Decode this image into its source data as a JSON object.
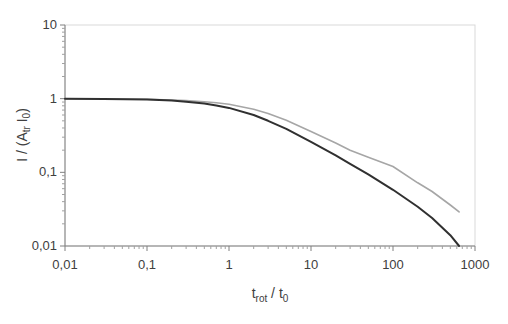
{
  "chart_data": {
    "type": "line",
    "title": "",
    "xlabel": "t_rot / t_0",
    "xlabel_main": "t",
    "xlabel_sub1": "rot",
    "xlabel_mid": " / t",
    "xlabel_sub2": "0",
    "ylabel": "I / (A_tr I_0)",
    "ylabel_pre": "I / (A",
    "ylabel_sub": "tr",
    "ylabel_mid": " I",
    "ylabel_sub2": "0",
    "ylabel_post": ")",
    "xscale": "log",
    "yscale": "log",
    "xlim": [
      0.01,
      1000
    ],
    "ylim": [
      0.01,
      10
    ],
    "grid": false,
    "legend": "none",
    "x_tick_labels": [
      "0,01",
      "0,1",
      "1",
      "10",
      "100",
      "1000"
    ],
    "y_tick_labels": [
      "0,01",
      "0,1",
      "1",
      "10"
    ],
    "series": [
      {
        "name": "dark curve",
        "color": "#303030",
        "x": [
          0.01,
          0.03,
          0.1,
          0.2,
          0.3,
          0.5,
          0.7,
          1,
          2,
          3,
          5,
          10,
          20,
          30,
          50,
          100,
          200,
          300,
          500,
          640
        ],
        "y": [
          1.0,
          0.99,
          0.97,
          0.94,
          0.91,
          0.86,
          0.81,
          0.75,
          0.6,
          0.5,
          0.39,
          0.26,
          0.17,
          0.13,
          0.094,
          0.058,
          0.034,
          0.024,
          0.014,
          0.01
        ]
      },
      {
        "name": "gray curve",
        "color": "#a6a6a6",
        "x": [
          0.01,
          0.03,
          0.1,
          0.2,
          0.3,
          0.5,
          0.7,
          1,
          2,
          3,
          5,
          10,
          20,
          30,
          50,
          100,
          200,
          300,
          500,
          640
        ],
        "y": [
          1.0,
          0.99,
          0.98,
          0.96,
          0.94,
          0.91,
          0.88,
          0.84,
          0.72,
          0.63,
          0.51,
          0.36,
          0.25,
          0.2,
          0.16,
          0.12,
          0.072,
          0.055,
          0.036,
          0.029
        ]
      }
    ]
  }
}
